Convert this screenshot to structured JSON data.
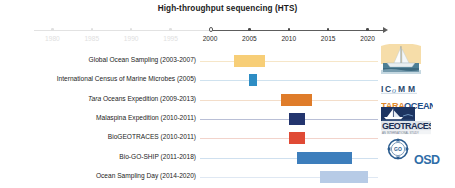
{
  "figure": {
    "title": "High-throughput sequencing (HTS)"
  },
  "chart_data": {
    "type": "bar",
    "orientation": "horizontal-timeline",
    "title": "High-throughput sequencing (HTS)",
    "xlabel": "",
    "ylabel": "",
    "xlim": [
      1978,
      2022
    ],
    "grid": false,
    "legend": "none",
    "axis": {
      "ticks": [
        {
          "label": "1980",
          "value": 1980,
          "faded": true,
          "style": "dot"
        },
        {
          "label": "1985",
          "value": 1985,
          "faded": true,
          "style": "dot"
        },
        {
          "label": "1990",
          "value": 1990,
          "faded": true,
          "style": "dot"
        },
        {
          "label": "1995",
          "value": 1995,
          "faded": true,
          "style": "dot"
        },
        {
          "label": "2000",
          "value": 2000,
          "faded": false,
          "style": "hollow"
        },
        {
          "label": "2005",
          "value": 2005,
          "faded": false,
          "style": "dot"
        },
        {
          "label": "2010",
          "value": 2010,
          "faded": false,
          "style": "dot"
        },
        {
          "label": "2015",
          "value": 2015,
          "faded": false,
          "style": "dot"
        },
        {
          "label": "2020",
          "value": 2020,
          "faded": false,
          "style": "dot"
        }
      ],
      "arrow_end": 2022
    },
    "categories": [
      "Global Ocean Sampling (2003-2007)",
      "International Census of Marine Microbes (2005)",
      "Tara Oceans  Expedition (2009-2013)",
      "Malaspina Expedition (2010-2011)",
      "BioGEOTRACES (2010-2011)",
      "Bio-GO-SHIP (2011-2018)",
      "Ocean Sampling Day (2014-2020)"
    ],
    "series": [
      {
        "name": "expedition span",
        "bars": [
          {
            "label": "Global Ocean Sampling (2003-2007)",
            "start": 2003,
            "end": 2007,
            "color": "#f7ce77",
            "line_color": "#f6e6c8"
          },
          {
            "label": "International Census of Marine Microbes (2005)",
            "start": 2005,
            "end": 2006,
            "color": "#2e8dc4",
            "line_color": "#cfe2ef"
          },
          {
            "label": "Tara Oceans  Expedition (2009-2013)",
            "start": 2009,
            "end": 2013,
            "color": "#df7c2a",
            "line_color": "#f3ddc9"
          },
          {
            "label": "Malaspina Expedition (2010-2011)",
            "start": 2010,
            "end": 2012,
            "color": "#23356e",
            "line_color": "#b9bfd6"
          },
          {
            "label": "BioGEOTRACES (2010-2011)",
            "start": 2010,
            "end": 2012,
            "color": "#e04a35",
            "line_color": "#f2d3cb"
          },
          {
            "label": "Bio-GO-SHIP (2011-2018)",
            "start": 2011,
            "end": 2018,
            "color": "#3d7ebc",
            "line_color": "#cfe0ef"
          },
          {
            "label": "Ocean Sampling Day (2014-2020)",
            "start": 2014,
            "end": 2020,
            "color": "#b7cbe6",
            "line_color": "#dfe8f3"
          }
        ]
      }
    ]
  },
  "rows": [
    {
      "label": "Global Ocean Sampling (2003-2007)",
      "label_plain": "Global Ocean Sampling (2003-2007)",
      "italic_prefix": "",
      "years": "2003-2007",
      "logo_name": "global-ocean-sampling-logo"
    },
    {
      "label": "International Census of Marine Microbes (2005)",
      "label_plain": "International Census of Marine Microbes (2005)",
      "italic_prefix": "",
      "years": "2005",
      "logo_name": "icomm-logo",
      "logo_text": "ICoMM"
    },
    {
      "label": "Tara Oceans  Expedition (2009-2013)",
      "label_plain": "Oceans  Expedition (2009-2013)",
      "italic_prefix": "Tara",
      "years": "2009-2013",
      "logo_name": "tara-oceans-logo",
      "logo_text_1": "TARA",
      "logo_text_2": "OCEANS"
    },
    {
      "label": "Malaspina Expedition (2010-2011)",
      "label_plain": "Malaspina Expedition (2010-2011)",
      "italic_prefix": "",
      "years": "2010-2011",
      "logo_name": "malaspina-logo",
      "logo_text": "Malaspina 2010"
    },
    {
      "label": "BioGEOTRACES (2010-2011)",
      "label_plain": "BioGEOTRACES (2010-2011)",
      "italic_prefix": "",
      "years": "2010-2011",
      "logo_name": "geotraces-logo",
      "logo_text": "GEOTRACES"
    },
    {
      "label": "Bio-GO-SHIP (2011-2018)",
      "label_plain": "Bio-GO-SHIP (2011-2018)",
      "italic_prefix": "",
      "years": "2011-2018",
      "logo_name": "bio-go-ship-logo",
      "logo_text": "GO-SHIP"
    },
    {
      "label": "Ocean Sampling Day (2014-2020)",
      "label_plain": "Ocean Sampling Day (2014-2020)",
      "italic_prefix": "",
      "years": "2014-2020",
      "logo_name": "osd-logo",
      "logo_text": "OSD"
    }
  ],
  "colors": {
    "axis": "#5d5d5d",
    "axis_faded": "#e0e0e0",
    "text": "#232323",
    "background": "#ffffff"
  }
}
